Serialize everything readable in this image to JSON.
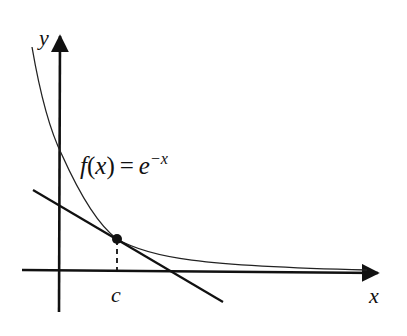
{
  "diagram": {
    "axes": {
      "x_label": "x",
      "y_label": "y"
    },
    "function_label": {
      "lhs_f": "f",
      "lhs_open": "(",
      "lhs_var": "x",
      "lhs_close": ")",
      "equals": "=",
      "base": "e",
      "exponent": "−x"
    },
    "point_label": "c",
    "colors": {
      "stroke": "#111111",
      "background": "#ffffff"
    }
  }
}
